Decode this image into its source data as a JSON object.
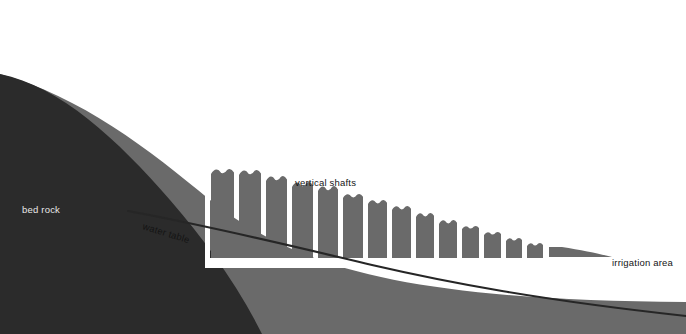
{
  "figure": {
    "width": 686,
    "height": 334
  },
  "labels": {
    "bed_rock": "bed rock",
    "water_table": "water table",
    "vertical_shafts": "vertical shafts",
    "irrigation_area": "irrigation area"
  },
  "colors": {
    "background": "#ffffff",
    "bedrock": "#2b2b2b",
    "soil": "#6a6a6a",
    "shaft": "#6a6a6a",
    "channel": "#ffffff",
    "water_line": "#262626",
    "label_dark_bg": "#e8e8e8",
    "label_light_bg": "#141414"
  },
  "geometry": {
    "bedrock_surface": "M 0,74 C 60,86 118,140 170,200 C 210,246 240,290 262,334 L 0,334 Z",
    "soil_surface": "M 0,74 C 80,96 150,150 210,200 C 300,272 420,300 686,302 L 686,334 L 0,334 Z",
    "water_table_line": "M 128,211 C 220,228 300,248 372,265 C 450,283 540,300 686,316",
    "channel_band": {
      "x": 205,
      "y": 258,
      "width": 481,
      "height": 10
    },
    "channel_riser": {
      "x": 205,
      "y": 168,
      "width": 5,
      "height": 92
    }
  },
  "shafts": [
    {
      "x": 211,
      "y": 169,
      "width": 23,
      "height": 89,
      "notch": 5
    },
    {
      "x": 239,
      "y": 170,
      "width": 22,
      "height": 88,
      "notch": 5
    },
    {
      "x": 266,
      "y": 176,
      "width": 21,
      "height": 82,
      "notch": 5
    },
    {
      "x": 292,
      "y": 182,
      "width": 21,
      "height": 76,
      "notch": 5
    },
    {
      "x": 318,
      "y": 186,
      "width": 20,
      "height": 72,
      "notch": 5
    },
    {
      "x": 343,
      "y": 194,
      "width": 20,
      "height": 64,
      "notch": 4
    },
    {
      "x": 368,
      "y": 200,
      "width": 19,
      "height": 58,
      "notch": 4
    },
    {
      "x": 392,
      "y": 206,
      "width": 19,
      "height": 52,
      "notch": 4
    },
    {
      "x": 416,
      "y": 213,
      "width": 18,
      "height": 45,
      "notch": 4
    },
    {
      "x": 439,
      "y": 220,
      "width": 18,
      "height": 38,
      "notch": 4
    },
    {
      "x": 462,
      "y": 226,
      "width": 17,
      "height": 32,
      "notch": 3
    },
    {
      "x": 484,
      "y": 232,
      "width": 17,
      "height": 26,
      "notch": 3
    },
    {
      "x": 506,
      "y": 238,
      "width": 16,
      "height": 20,
      "notch": 3
    },
    {
      "x": 527,
      "y": 243,
      "width": 16,
      "height": 15,
      "notch": 3
    }
  ],
  "taper": {
    "path": "M 549,247 L 562,247 C 582,250 600,254 612,257 L 549,257 Z"
  },
  "label_positions": {
    "bed_rock": {
      "x": 22,
      "y": 213
    },
    "water_table": {
      "x": 142,
      "y": 229,
      "rotate": 17
    },
    "vertical_shafts": {
      "x": 295,
      "y": 186
    },
    "irrigation_area": {
      "x": 612,
      "y": 266
    }
  }
}
